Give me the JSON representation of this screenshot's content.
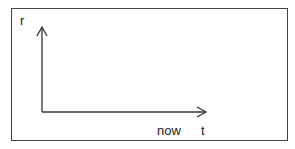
{
  "diagram": {
    "type": "axes-sketch",
    "y_axis_label": "r",
    "x_axis_label": "t",
    "x_marker_label": "now",
    "colors": {
      "line": "#333333",
      "frame": "#444444",
      "background": "#ffffff"
    }
  }
}
